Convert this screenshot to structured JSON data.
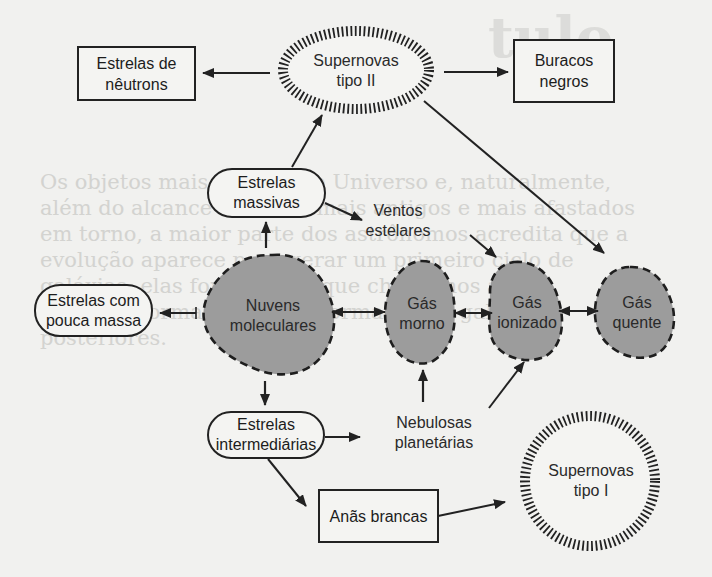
{
  "diagram": {
    "title": "",
    "colors": {
      "background": "#f1f1ef",
      "stroke": "#222222",
      "gas_fill": "#9c9c9c",
      "text": "#2a2a2a"
    },
    "nodes": {
      "neutron_stars": {
        "line1": "Estrelas de",
        "line2": "nêutrons",
        "shape": "rectangle"
      },
      "supernova_ii": {
        "line1": "Supernovas",
        "line2": "tipo II",
        "shape": "hatched-ellipse"
      },
      "black_holes": {
        "line1": "Buracos",
        "line2": "negros",
        "shape": "rectangle"
      },
      "massive_stars": {
        "line1": "Estrelas",
        "line2": "massivas",
        "shape": "pill"
      },
      "stellar_winds": {
        "line1": "Ventos",
        "line2": "estelares",
        "shape": "text"
      },
      "low_mass_stars": {
        "line1": "Estrelas com",
        "line2": "pouca massa",
        "shape": "pill"
      },
      "molecular_clouds": {
        "line1": "Nuvens",
        "line2": "moleculares",
        "shape": "dashed-blob"
      },
      "warm_gas": {
        "line1": "Gás",
        "line2": "morno",
        "shape": "dashed-blob"
      },
      "ionized_gas": {
        "line1": "Gás",
        "line2": "ionizado",
        "shape": "dashed-blob"
      },
      "hot_gas": {
        "line1": "Gás",
        "line2": "quente",
        "shape": "dashed-blob"
      },
      "intermediate_stars": {
        "line1": "Estrelas",
        "line2": "intermediárias",
        "shape": "pill"
      },
      "planetary_nebulae": {
        "line1": "Nebulosas",
        "line2": "planetárias",
        "shape": "text"
      },
      "white_dwarfs": {
        "line1": "Anãs brancas",
        "shape": "rectangle"
      },
      "supernova_i": {
        "line1": "Supernovas",
        "line2": "tipo I",
        "shape": "hatched-circle"
      }
    },
    "edges": [
      {
        "from": "Supernovas tipo II",
        "to": "Estrelas de nêutrons"
      },
      {
        "from": "Supernovas tipo II",
        "to": "Buracos negros"
      },
      {
        "from": "Supernovas tipo II",
        "to": "Gás quente"
      },
      {
        "from": "Estrelas massivas",
        "to": "Supernovas tipo II"
      },
      {
        "from": "Estrelas massivas",
        "to": "Ventos estelares"
      },
      {
        "from": "Ventos estelares",
        "to": "Gás ionizado"
      },
      {
        "from": "Nuvens moleculares",
        "to": "Estrelas massivas"
      },
      {
        "from": "Nuvens moleculares",
        "to": "Estrelas com pouca massa"
      },
      {
        "from": "Nuvens moleculares",
        "to": "Estrelas intermediárias"
      },
      {
        "from": "Nuvens moleculares",
        "to": "Gás morno",
        "bidirectional": true
      },
      {
        "from": "Gás morno",
        "to": "Gás ionizado",
        "bidirectional": true
      },
      {
        "from": "Gás ionizado",
        "to": "Gás quente",
        "bidirectional": true
      },
      {
        "from": "Estrelas intermediárias",
        "to": "Nebulosas planetárias"
      },
      {
        "from": "Estrelas intermediárias",
        "to": "Anãs brancas"
      },
      {
        "from": "Nebulosas planetárias",
        "to": "Gás morno"
      },
      {
        "from": "Nebulosas planetárias",
        "to": "Gás ionizado"
      },
      {
        "from": "Anãs brancas",
        "to": "Supernovas tipo I"
      }
    ]
  },
  "background_bleed": {
    "heading": "tulo",
    "lines": [
      "Os objetos mais antigos no Universo e, naturalmente,",
      "além do alcance atual: os mais antigos e mais afastados",
      "em torno, a maior parte dos astrônomos acredita que a",
      "evolução aparece para gerar um primeiro ciclo de",
      "galáxias, elas formaram o que chamamos agora",
      "vida e re-formadas para a formação de galáxias",
      "posteriores."
    ]
  }
}
